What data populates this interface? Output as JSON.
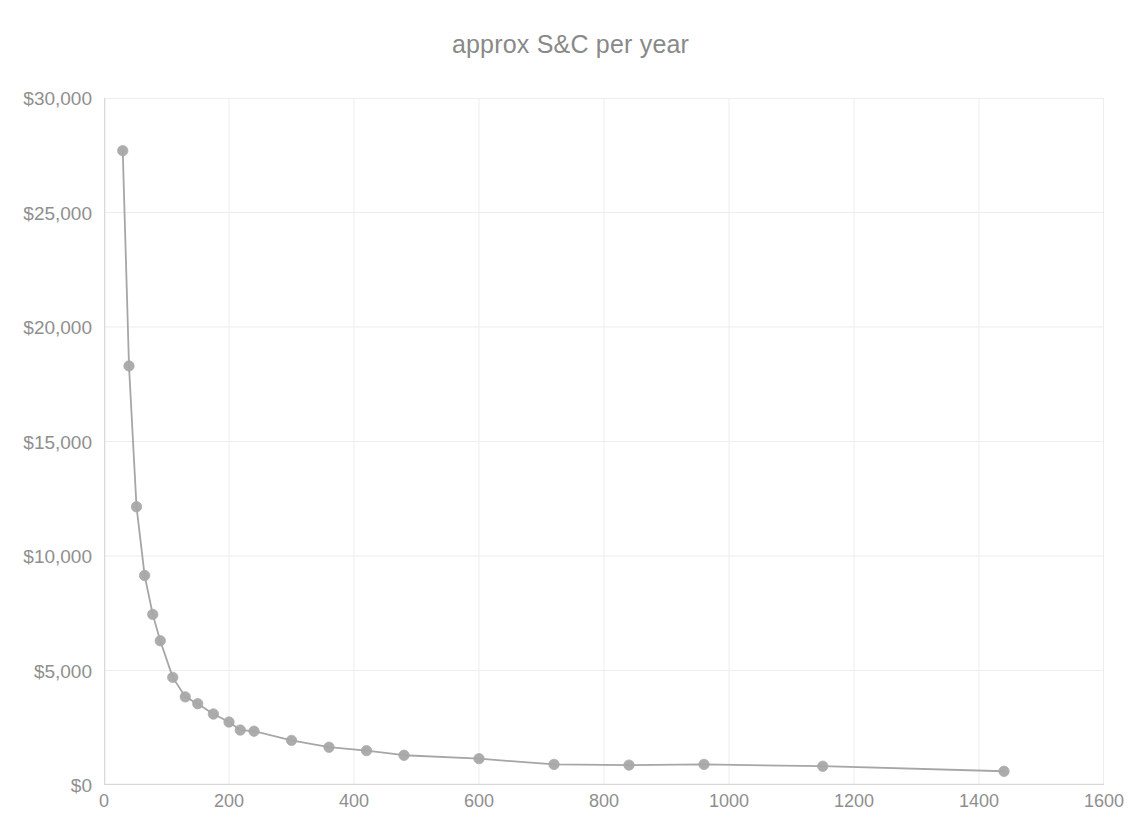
{
  "chart_data": {
    "type": "line",
    "title": "approx S&C per year",
    "xlabel": "",
    "ylabel": "",
    "xlim": [
      0,
      1600
    ],
    "ylim": [
      0,
      30000
    ],
    "grid": true,
    "legend": false,
    "legend_position": "none",
    "x_ticks": [
      0,
      200,
      400,
      600,
      800,
      1000,
      1200,
      1400,
      1600
    ],
    "x_tick_labels": [
      "0",
      "200",
      "400",
      "600",
      "800",
      "1000",
      "1200",
      "1400",
      "1600"
    ],
    "y_ticks": [
      0,
      5000,
      10000,
      15000,
      20000,
      25000,
      30000
    ],
    "y_tick_labels": [
      "$0",
      "$5,000",
      "$10,000",
      "$15,000",
      "$20,000",
      "$25,000",
      "$30,000"
    ],
    "series": [
      {
        "name": "approx S&C per year",
        "marker": "circle",
        "color": "#a6a6a6",
        "x": [
          30,
          40,
          52,
          65,
          78,
          90,
          110,
          130,
          150,
          175,
          200,
          218,
          240,
          300,
          360,
          420,
          480,
          600,
          720,
          840,
          960,
          1150,
          1440
        ],
        "y": [
          27700,
          18300,
          12150,
          9150,
          7450,
          6300,
          4700,
          3850,
          3550,
          3100,
          2750,
          2400,
          2350,
          1950,
          1650,
          1500,
          1300,
          1150,
          900,
          870,
          900,
          820,
          600
        ]
      }
    ],
    "colors": {
      "line": "#a6a6a6",
      "marker": "#a8a8a8",
      "gridline": "#ededed",
      "axis": "#d9d9d9",
      "text": "#8f8f8f",
      "title": "#898989",
      "background": "#ffffff"
    }
  }
}
